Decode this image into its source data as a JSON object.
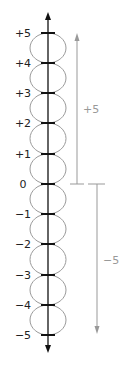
{
  "diagram": {
    "title": "",
    "number_line": {
      "ticks": [
        {
          "value": 5,
          "label": "+5",
          "y": 33
        },
        {
          "value": 4,
          "label": "+4",
          "y": 63
        },
        {
          "value": 3,
          "label": "+3",
          "y": 93
        },
        {
          "value": 2,
          "label": "+2",
          "y": 123
        },
        {
          "value": 1,
          "label": "+1",
          "y": 154
        },
        {
          "value": 0,
          "label": "0",
          "y": 184
        },
        {
          "value": -1,
          "label": "−1",
          "y": 214
        },
        {
          "value": -2,
          "label": "−2",
          "y": 244
        },
        {
          "value": -3,
          "label": "−3",
          "y": 275
        },
        {
          "value": -4,
          "label": "−4",
          "y": 305
        },
        {
          "value": -5,
          "label": "−5",
          "y": 335
        }
      ]
    },
    "positive_arrow": {
      "label": "+5",
      "color": "#999999"
    },
    "negative_arrow": {
      "label": "−5",
      "color": "#999999"
    },
    "axis_color": "#111111",
    "circle_color": "#999999"
  }
}
